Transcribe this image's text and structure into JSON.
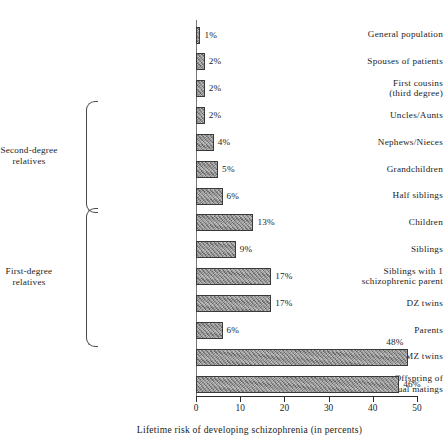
{
  "chart_data": {
    "type": "bar",
    "orientation": "horizontal",
    "title": "",
    "xlabel": "Lifetime risk of developing schizophrenia (in percents)",
    "ylabel": "",
    "xlim": [
      0,
      50
    ],
    "xticks": [
      0,
      10,
      20,
      30,
      40,
      50
    ],
    "xtick_labels": [
      "0",
      "10",
      "20",
      "30",
      "40",
      "50"
    ],
    "grid": false,
    "legend": "none",
    "bar_color": "#8d8d8d",
    "bar_border_color": "#3a3a3a",
    "categories": [
      "General population",
      "Spouses of patients",
      "First cousins\n(third degree)",
      "Uncles/Aunts",
      "Nephews/Nieces",
      "Grandchildren",
      "Half siblings",
      "Children",
      "Siblings",
      "Siblings with 1\nschizophrenic parent",
      "DZ twins",
      "Parents",
      "MZ twins",
      "Offspring of\ndual matings"
    ],
    "values": [
      1,
      2,
      2,
      2,
      4,
      5,
      6,
      13,
      9,
      17,
      17,
      6,
      48,
      46
    ],
    "value_labels": [
      "1%",
      "2%",
      "2%",
      "2%",
      "4%",
      "5%",
      "6%",
      "13%",
      "9%",
      "17%",
      "17%",
      "6%",
      "48%",
      "46%"
    ],
    "value_label_position": [
      "right",
      "right",
      "right",
      "right",
      "right",
      "right",
      "right",
      "right",
      "right",
      "right",
      "right",
      "right",
      "above",
      "right"
    ],
    "groups": [
      {
        "label": "Second-degree\nrelatives",
        "first_index": 3,
        "last_index": 6
      },
      {
        "label": "First-degree\nrelatives",
        "first_index": 7,
        "last_index": 11
      }
    ]
  }
}
